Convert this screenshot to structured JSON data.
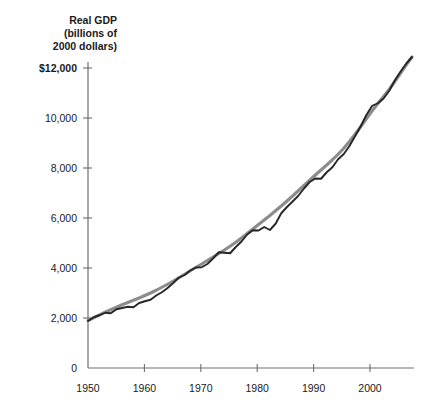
{
  "chart_data": {
    "type": "line",
    "title": "Real GDP (billions of 2000 dollars)",
    "title_lines": [
      "Real GDP",
      "(billions of",
      "2000 dollars)"
    ],
    "xlabel": "",
    "ylabel": "Real GDP (billions of 2000 dollars)",
    "xlim": [
      1950,
      2007
    ],
    "ylim": [
      0,
      12000
    ],
    "grid": false,
    "legend": "none",
    "ytick_labels": [
      "$12,000",
      "10,000",
      "8,000",
      "6,000",
      "4,000",
      "2,000",
      "0"
    ],
    "ytick_values": [
      12000,
      10000,
      8000,
      6000,
      4000,
      2000,
      0
    ],
    "xtick_labels": [
      "1950",
      "1960",
      "1970",
      "1980",
      "1990",
      "2000"
    ],
    "xtick_values": [
      1950,
      1960,
      1970,
      1980,
      1990,
      2000
    ],
    "x": [
      1950,
      1951,
      1952,
      1953,
      1954,
      1955,
      1956,
      1957,
      1958,
      1959,
      1960,
      1961,
      1962,
      1963,
      1964,
      1965,
      1966,
      1967,
      1968,
      1969,
      1970,
      1971,
      1972,
      1973,
      1974,
      1975,
      1976,
      1977,
      1978,
      1979,
      1980,
      1981,
      1982,
      1983,
      1984,
      1985,
      1986,
      1987,
      1988,
      1989,
      1990,
      1991,
      1992,
      1993,
      1994,
      1995,
      1996,
      1997,
      1998,
      1999,
      2000,
      2001,
      2002,
      2003,
      2004,
      2005,
      2006,
      2007
    ],
    "series": [
      {
        "name": "Real GDP",
        "color": "#262626",
        "values": [
          1880,
          2030,
          2110,
          2210,
          2190,
          2350,
          2400,
          2450,
          2430,
          2600,
          2670,
          2730,
          2900,
          3030,
          3200,
          3400,
          3620,
          3720,
          3900,
          4020,
          4030,
          4160,
          4380,
          4630,
          4610,
          4590,
          4840,
          5060,
          5340,
          5510,
          5500,
          5640,
          5520,
          5770,
          6190,
          6440,
          6660,
          6890,
          7180,
          7440,
          7580,
          7570,
          7830,
          8030,
          8350,
          8560,
          8880,
          9280,
          9680,
          10130,
          10490,
          10590,
          10780,
          11090,
          11510,
          11860,
          12180,
          12440
        ]
      },
      {
        "name": "Trend",
        "color": "#8c8c8c",
        "values": [
          1900,
          2010,
          2120,
          2230,
          2330,
          2430,
          2530,
          2620,
          2710,
          2800,
          2900,
          3000,
          3110,
          3230,
          3350,
          3480,
          3610,
          3750,
          3890,
          4030,
          4160,
          4300,
          4440,
          4580,
          4720,
          4870,
          5030,
          5200,
          5380,
          5560,
          5740,
          5920,
          6100,
          6290,
          6480,
          6680,
          6880,
          7090,
          7300,
          7510,
          7720,
          7920,
          8120,
          8330,
          8550,
          8790,
          9060,
          9350,
          9660,
          9980,
          10290,
          10580,
          10860,
          11150,
          11470,
          11800,
          12130,
          12440
        ]
      }
    ]
  },
  "plot_geometry": {
    "left": 88,
    "bottom": 368,
    "right": 412,
    "top": 68,
    "x_per_year": 5.64,
    "y_per_unit": 0.025
  }
}
